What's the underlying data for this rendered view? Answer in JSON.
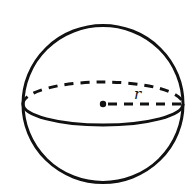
{
  "figure": {
    "type": "sphere",
    "radius_label": "r",
    "stroke_color": "#111111",
    "background": "#ffffff",
    "center": [
      103,
      104
    ],
    "radius": 79,
    "equator": {
      "rx": 80,
      "ry_front": 21,
      "ry_back": 22
    }
  }
}
